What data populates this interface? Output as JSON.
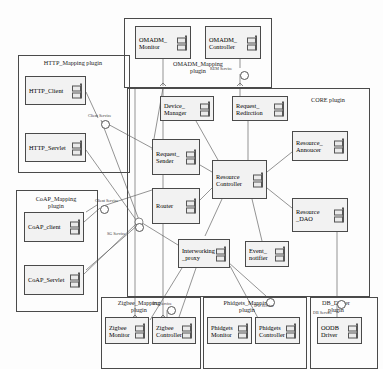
{
  "diagram": {
    "type": "uml-component-diagram"
  },
  "packages": [
    {
      "id": "omadm",
      "label": "OMADM_Mapping\nplugin",
      "x": 124,
      "y": 18,
      "w": 146,
      "h": 68,
      "label_x": 150,
      "label_y": 60,
      "label_w": 96
    },
    {
      "id": "http",
      "label": "HTTP_Mapping plugin",
      "x": 18,
      "y": 55,
      "w": 110,
      "h": 116,
      "label_x": 22,
      "label_y": 59,
      "label_w": 102
    },
    {
      "id": "core",
      "label": "CORE plugin",
      "x": 127,
      "y": 88,
      "w": 241,
      "h": 207,
      "label_x": 296,
      "label_y": 96,
      "label_w": 64
    },
    {
      "id": "coap",
      "label": "CoAP_Mapping\nplugin",
      "x": 16,
      "y": 190,
      "w": 80,
      "h": 120,
      "label_x": 20,
      "label_y": 195,
      "label_w": 72
    },
    {
      "id": "zigbee",
      "label": "Zigbee_Mapping\nplugin",
      "x": 101,
      "y": 297,
      "w": 98,
      "h": 70,
      "label_x": 104,
      "label_y": 299,
      "label_w": 70
    },
    {
      "id": "phidgets",
      "label": "Phidgets_Mapping\nplugin",
      "x": 203,
      "y": 297,
      "w": 102,
      "h": 70,
      "label_x": 208,
      "label_y": 299,
      "label_w": 78
    },
    {
      "id": "dbdriver",
      "label": "DB_Driver\nplugin",
      "x": 310,
      "y": 297,
      "w": 66,
      "h": 70,
      "label_x": 312,
      "label_y": 299,
      "label_w": 48
    }
  ],
  "components": [
    {
      "id": "omadm_monitor",
      "name": "OMADM_\nMonitor",
      "x": 135,
      "y": 26,
      "w": 56,
      "h": 33
    },
    {
      "id": "omadm_controller",
      "name": "OMADM_\nController",
      "x": 205,
      "y": 26,
      "w": 56,
      "h": 33
    },
    {
      "id": "http_client",
      "name": "HTTP_Client",
      "x": 25,
      "y": 76,
      "w": 61,
      "h": 29
    },
    {
      "id": "http_servlet",
      "name": "HTTP_Servlet",
      "x": 25,
      "y": 133,
      "w": 61,
      "h": 29
    },
    {
      "id": "device_manager",
      "name": "Device_\nManager",
      "x": 160,
      "y": 96,
      "w": 54,
      "h": 25
    },
    {
      "id": "request_redir",
      "name": "Request_\nRedirction",
      "x": 232,
      "y": 96,
      "w": 56,
      "h": 25
    },
    {
      "id": "resource_annoucer",
      "name": "Resource_\nAnnoucer",
      "x": 292,
      "y": 131,
      "w": 56,
      "h": 30
    },
    {
      "id": "request_sender",
      "name": "Request_\nSender",
      "x": 152,
      "y": 139,
      "w": 48,
      "h": 36
    },
    {
      "id": "resource_ctrl",
      "name": "Resource\nController",
      "x": 212,
      "y": 160,
      "w": 55,
      "h": 39
    },
    {
      "id": "router",
      "name": "Router",
      "x": 152,
      "y": 188,
      "w": 48,
      "h": 36
    },
    {
      "id": "resource_dao",
      "name": "Resource\n_DAO",
      "x": 292,
      "y": 198,
      "w": 56,
      "h": 34
    },
    {
      "id": "interwork_proxy",
      "name": "Interworking\n_proxy",
      "x": 178,
      "y": 239,
      "w": 52,
      "h": 29
    },
    {
      "id": "event_notifier",
      "name": "Event_\nnotifier",
      "x": 245,
      "y": 241,
      "w": 44,
      "h": 26
    },
    {
      "id": "coap_client",
      "name": "CoAP_client",
      "x": 24,
      "y": 212,
      "w": 60,
      "h": 30
    },
    {
      "id": "coap_servlet",
      "name": "CoAP_Servlet",
      "x": 24,
      "y": 265,
      "w": 60,
      "h": 30
    },
    {
      "id": "zigbee_monitor",
      "name": "Zigbee\nMonitor",
      "x": 105,
      "y": 317,
      "w": 44,
      "h": 27
    },
    {
      "id": "zigbee_ctrl",
      "name": "Zigbee\nController",
      "x": 152,
      "y": 317,
      "w": 44,
      "h": 27
    },
    {
      "id": "phidgets_monitor",
      "name": "Phidgets\nMonitor",
      "x": 207,
      "y": 317,
      "w": 45,
      "h": 27
    },
    {
      "id": "phidgets_ctrl",
      "name": "Phidgets\nController",
      "x": 255,
      "y": 317,
      "w": 45,
      "h": 27
    },
    {
      "id": "oodb_driver",
      "name": "OODB\nDriver",
      "x": 317,
      "y": 317,
      "w": 45,
      "h": 27
    }
  ],
  "services": [
    {
      "id": "rem_service",
      "label": "REM Service",
      "x": 210,
      "y": 66,
      "ball_x": 240,
      "ball_y": 71
    },
    {
      "id": "client_service_1",
      "label": "Client Service",
      "x": 88,
      "y": 113,
      "ball_x": 101,
      "ball_y": 120
    },
    {
      "id": "client_service_2",
      "label": "Client Service",
      "x": 95,
      "y": 198,
      "ball_x": 100,
      "ball_y": 205
    },
    {
      "id": "sg_service",
      "label": "SG Service",
      "x": 107,
      "y": 231,
      "ball_x": 135,
      "ball_y": 223
    },
    {
      "id": "ipu_service_1",
      "label": "IPU Service",
      "x": 152,
      "y": 301,
      "ball_x": 167,
      "ball_y": 306
    },
    {
      "id": "ipu_service_2",
      "label": "IPU Service",
      "x": 254,
      "y": 303,
      "ball_x": 266,
      "ball_y": 298
    },
    {
      "id": "db_service",
      "label": "DB Service",
      "x": 313,
      "y": 310,
      "ball_x": 337,
      "ball_y": 300
    }
  ],
  "connections": [
    "omadm_monitor-to-request_sender",
    "omadm_controller-to-request_redirction",
    "http_client-to-request_sender",
    "http_servlet-to-router",
    "coap_client-to-sg_service",
    "coap_servlet-to-router",
    "device_manager-to-resource_controller",
    "request_redir-to-resource_controller",
    "request_sender-to-resource_controller",
    "router-to-resource_controller",
    "resource_controller-to-resource_annoucer",
    "resource_controller-to-resource_dao",
    "resource_controller-to-interworking_proxy",
    "resource_controller-to-event_notifier",
    "interworking_proxy-to-zigbee_controller",
    "interworking_proxy-to-phidgets_controller",
    "resource_dao-to-oodb_driver"
  ]
}
